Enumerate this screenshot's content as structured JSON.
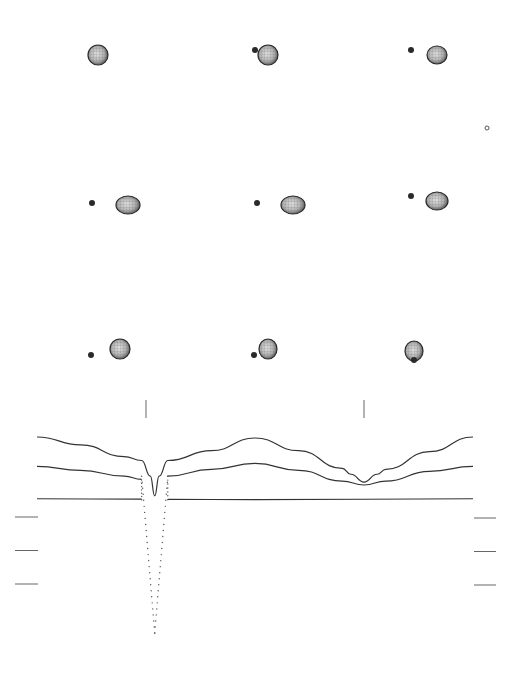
{
  "figure": {
    "title": "",
    "colors": {
      "background": "#ffffff",
      "primary_star_fill": "#b8b8b8",
      "primary_star_edge": "#2a2a2a",
      "companion_star": "#2a2a2a",
      "curve_stroke": "#333333",
      "dotted_eclipse": "#555555",
      "tick": "#666666"
    },
    "phase_panels": [
      {
        "row": 0,
        "col": 0,
        "companion": "hidden-behind",
        "companion_side": "none"
      },
      {
        "row": 0,
        "col": 1,
        "companion": "visible",
        "companion_side": "left-near"
      },
      {
        "row": 0,
        "col": 2,
        "companion": "visible",
        "companion_side": "left"
      },
      {
        "row": 1,
        "col": 0,
        "companion": "visible",
        "companion_side": "left-far"
      },
      {
        "row": 1,
        "col": 1,
        "companion": "visible",
        "companion_side": "left-far"
      },
      {
        "row": 1,
        "col": 2,
        "companion": "visible",
        "companion_side": "left"
      },
      {
        "row": 2,
        "col": 0,
        "companion": "visible",
        "companion_side": "left-low"
      },
      {
        "row": 2,
        "col": 1,
        "companion": "visible",
        "companion_side": "left-low-near"
      },
      {
        "row": 2,
        "col": 2,
        "companion": "in-front",
        "companion_side": "center-low"
      }
    ],
    "marker_small_circle": true
  },
  "chart_data": {
    "type": "line",
    "title": "",
    "xlabel": "",
    "ylabel": "",
    "x_range": [
      0.0,
      1.0
    ],
    "series": [
      {
        "name": "light-curve-upper",
        "style": "solid",
        "x": [
          0.0,
          0.1,
          0.2,
          0.24,
          0.26,
          0.27,
          0.28,
          0.3,
          0.4,
          0.5,
          0.6,
          0.7,
          0.72,
          0.75,
          0.78,
          0.8,
          0.9,
          1.0
        ],
        "y": [
          1.0,
          0.92,
          0.8,
          0.76,
          0.6,
          0.4,
          0.6,
          0.76,
          0.86,
          0.99,
          0.86,
          0.68,
          0.62,
          0.54,
          0.62,
          0.67,
          0.85,
          1.0
        ]
      },
      {
        "name": "light-curve-middle",
        "style": "solid",
        "x": [
          0.0,
          0.1,
          0.2,
          0.25,
          0.3,
          0.4,
          0.5,
          0.6,
          0.7,
          0.75,
          0.8,
          0.9,
          1.0
        ],
        "y": [
          0.7,
          0.66,
          0.6,
          0.56,
          0.6,
          0.67,
          0.73,
          0.66,
          0.55,
          0.51,
          0.55,
          0.65,
          0.7
        ],
        "gap": [
          0.24,
          0.3
        ]
      },
      {
        "name": "light-curve-lower",
        "style": "solid",
        "x": [
          0.0,
          0.5,
          1.0
        ],
        "y": [
          0.37,
          0.36,
          0.37
        ],
        "gap": [
          0.24,
          0.3
        ]
      },
      {
        "name": "primary-eclipse-dotted",
        "style": "dotted",
        "x": [
          0.24,
          0.25,
          0.26,
          0.27,
          0.28,
          0.29,
          0.3
        ],
        "y": [
          0.6,
          0.0,
          -0.6,
          -1.0,
          -0.6,
          0.0,
          0.6
        ]
      }
    ],
    "eclipse_markers": [
      {
        "name": "primary-eclipse",
        "phase": 0.25
      },
      {
        "name": "secondary-eclipse",
        "phase": 0.75
      }
    ],
    "scale_ticks_left": 3,
    "scale_ticks_right": 3,
    "grid": false,
    "legend": "none"
  }
}
